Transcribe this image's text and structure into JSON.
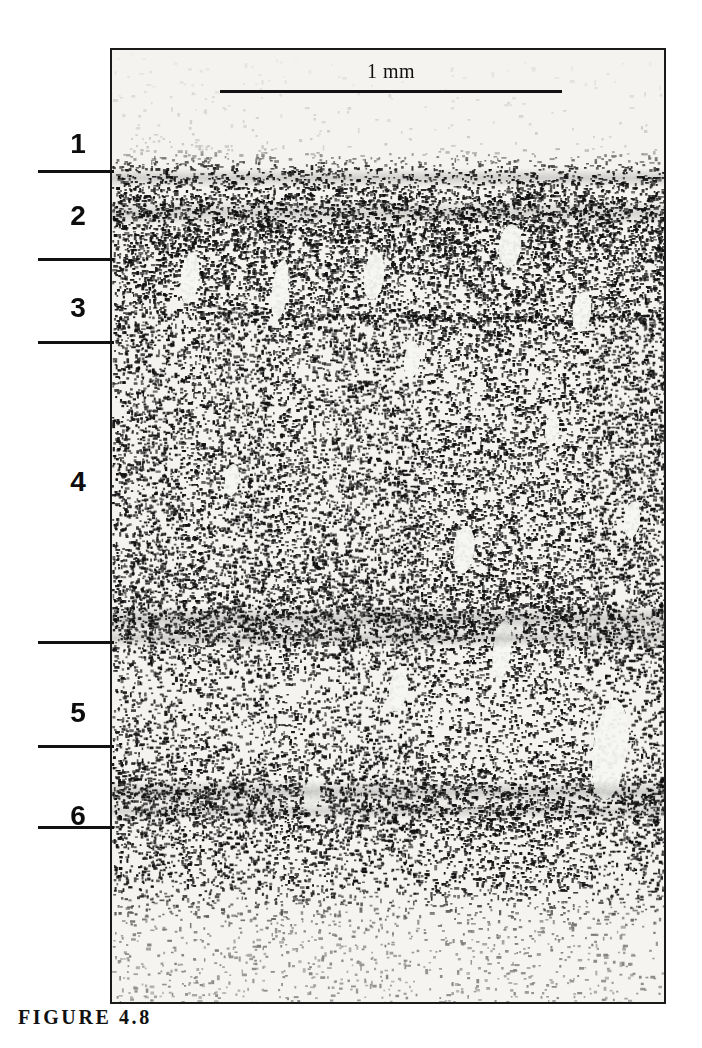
{
  "figure": {
    "caption": "FIGURE 4.8"
  },
  "scalebar": {
    "label": "1 mm",
    "length_px": 342,
    "represents": "1 mm"
  },
  "layers": [
    {
      "number": "1",
      "label_y": 128,
      "tick_y": 170
    },
    {
      "number": "2",
      "label_y": 200,
      "tick_y": 258
    },
    {
      "number": "3",
      "label_y": 292,
      "tick_y": 341
    },
    {
      "number": "4",
      "label_y": 466,
      "tick_y": 641
    },
    {
      "number": "5",
      "label_y": 697,
      "tick_y": 745
    },
    {
      "number": "6",
      "label_y": 800,
      "tick_y": 826
    }
  ],
  "micrograph": {
    "description": "Nissl-stained coronal section of cerebral cortex showing six cortical layers",
    "bands": [
      {
        "name": "layer-1-molecular",
        "top": 0,
        "height": 118,
        "density": 0.02,
        "tone": "very-light"
      },
      {
        "name": "layer-2-external-granular",
        "top": 118,
        "height": 92,
        "density": 0.62,
        "tone": "very-dark"
      },
      {
        "name": "layer-3-external-pyramidal",
        "top": 210,
        "height": 84,
        "density": 0.44,
        "tone": "dark"
      },
      {
        "name": "layer-3-4-transition",
        "top": 294,
        "height": 60,
        "density": 0.34,
        "tone": "medium"
      },
      {
        "name": "layer-4-internal-granular",
        "top": 354,
        "height": 190,
        "density": 0.4,
        "tone": "medium-dark"
      },
      {
        "name": "layer-4-5-dark-band",
        "top": 544,
        "height": 48,
        "density": 0.6,
        "tone": "very-dark"
      },
      {
        "name": "layer-5-internal-pyramidal",
        "top": 592,
        "height": 130,
        "density": 0.26,
        "tone": "light"
      },
      {
        "name": "layer-6-band",
        "top": 722,
        "height": 56,
        "density": 0.55,
        "tone": "very-dark"
      },
      {
        "name": "layer-6-multiform",
        "top": 778,
        "height": 62,
        "density": 0.3,
        "tone": "medium"
      },
      {
        "name": "white-matter",
        "top": 840,
        "height": 112,
        "density": 0.1,
        "tone": "very-light"
      }
    ]
  }
}
